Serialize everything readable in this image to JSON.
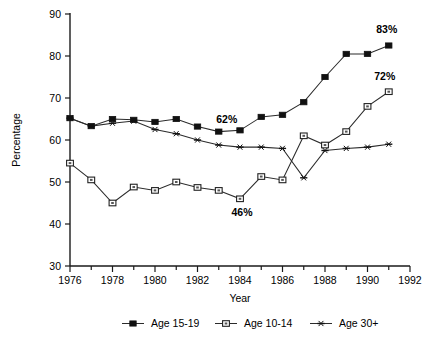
{
  "chart_data": {
    "type": "line",
    "title": "",
    "xlabel": "Year",
    "ylabel": "Percentage",
    "xlim": [
      1976,
      1992
    ],
    "ylim": [
      30,
      90
    ],
    "ytick_values": [
      30,
      40,
      50,
      60,
      70,
      80,
      90
    ],
    "ytick_labels": [
      "30",
      "40",
      "50",
      "60",
      "70",
      "80",
      "90"
    ],
    "xtick_values": [
      1976,
      1977,
      1978,
      1979,
      1980,
      1981,
      1982,
      1983,
      1984,
      1985,
      1986,
      1987,
      1988,
      1989,
      1990,
      1991,
      1992
    ],
    "xtick_labels_shown": [
      "1976",
      "1978",
      "1980",
      "1982",
      "1984",
      "1986",
      "1988",
      "1990",
      "1992"
    ],
    "xtick_labeled_values": [
      1976,
      1978,
      1980,
      1982,
      1984,
      1986,
      1988,
      1990,
      1992
    ],
    "grid": false,
    "legend_position": "bottom",
    "x": [
      1976,
      1977,
      1978,
      1979,
      1980,
      1981,
      1982,
      1983,
      1984,
      1985,
      1986,
      1987,
      1988,
      1989,
      1990,
      1991
    ],
    "series": [
      {
        "name": "Age 15-19",
        "marker": "filled-square",
        "color": "#111111",
        "values": [
          65.2,
          63.3,
          65.0,
          64.8,
          64.3,
          65.0,
          63.2,
          62.0,
          62.3,
          65.5,
          66.0,
          69.0,
          75.0,
          80.5,
          80.5,
          82.5
        ]
      },
      {
        "name": "Age 10-14",
        "marker": "open-square",
        "color": "#111111",
        "values": [
          54.5,
          50.5,
          45.0,
          48.8,
          48.0,
          50.0,
          48.7,
          48.0,
          46.0,
          51.3,
          50.5,
          61.0,
          58.8,
          62.0,
          68.0,
          71.5
        ]
      },
      {
        "name": "Age 30+",
        "marker": "asterisk",
        "color": "#111111",
        "values": [
          65.2,
          63.3,
          64.0,
          64.5,
          62.5,
          61.5,
          60.0,
          58.8,
          58.3,
          58.3,
          58.0,
          51.0,
          57.5,
          58.0,
          58.3,
          59.0
        ]
      }
    ],
    "annotations": [
      {
        "text": "62%",
        "series": "Age 15-19",
        "x": 1983,
        "y": 62.0
      },
      {
        "text": "83%",
        "series": "Age 15-19",
        "x": 1991,
        "y": 82.5
      },
      {
        "text": "46%",
        "series": "Age 10-14",
        "x": 1984,
        "y": 46.0
      },
      {
        "text": "72%",
        "series": "Age 10-14",
        "x": 1991,
        "y": 71.5
      }
    ]
  },
  "legend": {
    "items": [
      {
        "label": "Age 15-19",
        "marker": "filled-square"
      },
      {
        "label": "Age 10-14",
        "marker": "open-square"
      },
      {
        "label": "Age 30+",
        "marker": "asterisk"
      }
    ]
  }
}
